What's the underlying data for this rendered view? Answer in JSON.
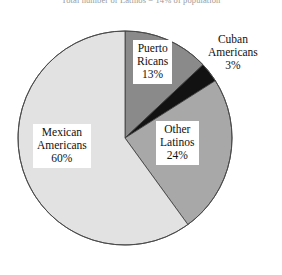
{
  "figure": {
    "title_partial": "Total number of Latinos = 14% of population",
    "background_color": "#ffffff"
  },
  "chart_data": {
    "type": "pie",
    "title": "Total number of Latinos = 14% of population",
    "xlabel": "",
    "ylabel": "",
    "legend_position": "none",
    "grid": false,
    "start_angle_deg": 0,
    "direction": "clockwise",
    "categories": [
      "Puerto Ricans",
      "Cuban Americans",
      "Other Latinos",
      "Mexican Americans"
    ],
    "values": [
      13,
      3,
      24,
      60
    ],
    "value_unit": "%",
    "colors": [
      "#8a8a8a",
      "#121212",
      "#a8a8a8",
      "#e2e2e2"
    ],
    "outline_color": "#3a3a3a",
    "slices": [
      {
        "name": "Puerto Ricans",
        "label_line1": "Puerto",
        "label_line2": "Ricans",
        "value_label": "13%",
        "value": 13,
        "color": "#8a8a8a",
        "label_placement": "inside"
      },
      {
        "name": "Cuban Americans",
        "label_line1": "Cuban",
        "label_line2": "Americans",
        "value_label": "3%",
        "value": 3,
        "color": "#121212",
        "label_placement": "outside"
      },
      {
        "name": "Other Latinos",
        "label_line1": "Other",
        "label_line2": "Latinos",
        "value_label": "24%",
        "value": 24,
        "color": "#a8a8a8",
        "label_placement": "inside"
      },
      {
        "name": "Mexican Americans",
        "label_line1": "Mexican",
        "label_line2": "Americans",
        "value_label": "60%",
        "value": 60,
        "color": "#e2e2e2",
        "label_placement": "inside"
      }
    ]
  }
}
